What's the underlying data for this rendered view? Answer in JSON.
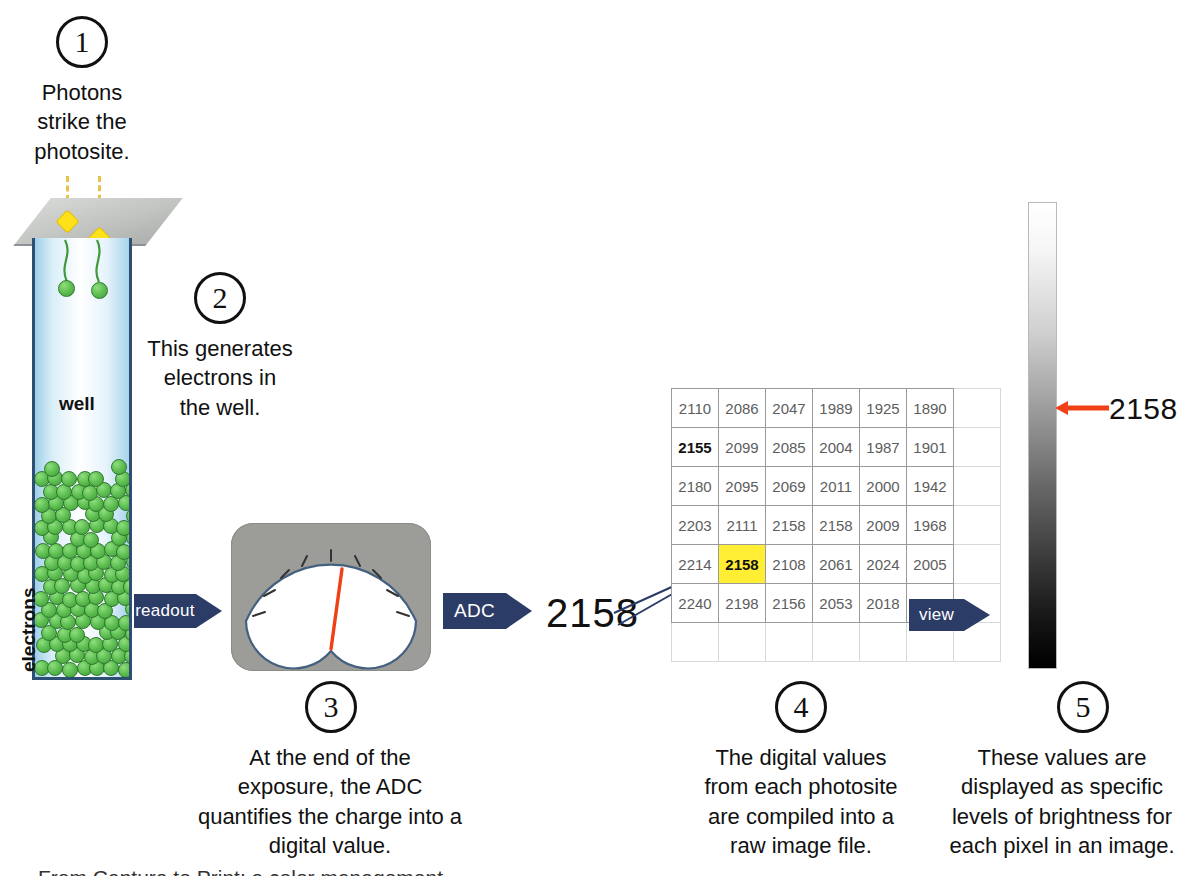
{
  "diagram": {
    "title_steps": [
      "1",
      "2",
      "3",
      "4",
      "5"
    ],
    "steps": [
      {
        "number": "1",
        "caption": "Photons\nstrike the\nphotosite."
      },
      {
        "number": "2",
        "caption": "This generates\nelectrons in\nthe well."
      },
      {
        "number": "3",
        "caption": "At the end of the\nexposure, the ADC\nquantifies the charge into a\ndigital value."
      },
      {
        "number": "4",
        "caption": "The digital values\nfrom each photosite\nare compiled into a\nraw image file."
      },
      {
        "number": "5",
        "caption": "These values are\ndisplayed as specific\nlevels of brightness for\neach pixel in an image."
      }
    ]
  },
  "photosite": {
    "well_label": "well",
    "electrons_label": "electrons"
  },
  "arrows": {
    "readout_label": "readout",
    "adc_label": "ADC",
    "view_label": "view"
  },
  "adc_output": {
    "value": "2158"
  },
  "brightness_bar": {
    "value": "2158",
    "top_color": "#ffffff",
    "bottom_color": "#000000",
    "marker_color": "#ef4018"
  },
  "colors": {
    "arrow_blue": "#2b3c66",
    "highlight_yellow": "#ffee33",
    "electron_green": "#5fbf52",
    "photon_yellow": "#ffe11a",
    "needle_red": "#ef4018",
    "meter_gray": "#9c9c99"
  },
  "bottom_cropped_caption": "From Capture to Print: a color management primer",
  "chart_data": {
    "type": "table",
    "columns": 7,
    "rows": 7,
    "highlighted_cell": {
      "row": 4,
      "col": 1,
      "value": "2158"
    },
    "bold_cell": {
      "row": 1,
      "col": 0,
      "value": "2155"
    },
    "values": [
      [
        "2110",
        "2086",
        "2047",
        "1989",
        "1925",
        "1890",
        ""
      ],
      [
        "2155",
        "2099",
        "2085",
        "2004",
        "1987",
        "1901",
        ""
      ],
      [
        "2180",
        "2095",
        "2069",
        "2011",
        "2000",
        "1942",
        ""
      ],
      [
        "2203",
        "2111",
        "2158",
        "2158",
        "2009",
        "1968",
        ""
      ],
      [
        "2214",
        "2158",
        "2108",
        "2061",
        "2024",
        "2005",
        ""
      ],
      [
        "2240",
        "2198",
        "2156",
        "2053",
        "2018",
        "2006",
        ""
      ],
      [
        "",
        "",
        "",
        "",
        "",
        "",
        ""
      ]
    ]
  }
}
